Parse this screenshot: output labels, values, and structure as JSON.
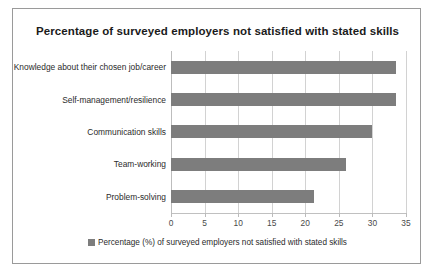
{
  "chart_data": {
    "type": "bar",
    "orientation": "horizontal",
    "title": "Percentage of surveyed employers not satisfied with stated skills",
    "categories": [
      "Knowledge about their chosen job/career",
      "Self-management/resilience",
      "Communication skills",
      "Team-working",
      "Problem-solving"
    ],
    "values": [
      33.5,
      33.5,
      30,
      26,
      21.3
    ],
    "series": [
      {
        "name": "Percentage (%) of surveyed employers not satisfied with stated skills",
        "values": [
          33.5,
          33.5,
          30,
          26,
          21.3
        ]
      }
    ],
    "xlabel": "",
    "ylabel": "",
    "xlim": [
      0,
      35
    ],
    "xticks": [
      0,
      5,
      10,
      15,
      20,
      25,
      30,
      35
    ],
    "xtick_labels": [
      "0",
      "5",
      "10",
      "15",
      "20",
      "25",
      "30",
      "35"
    ],
    "grid": true,
    "grid_axis": "x",
    "legend": {
      "position": "bottom",
      "entries": [
        "Percentage (%) of surveyed employers not satisfied with stated skills"
      ]
    },
    "colors": {
      "bar": "#7d7d7d",
      "gridline": "#d2d2d2",
      "border": "#9a9a9a",
      "background": "#ffffff",
      "title_text": "#1b1b1b",
      "tick_text": "#4a4a4a"
    }
  }
}
